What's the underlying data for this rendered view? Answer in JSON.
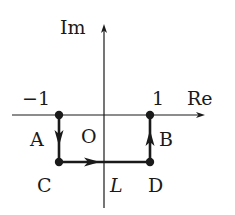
{
  "diagram": {
    "type": "complex-plane-contour",
    "axes": {
      "real_label": "Re",
      "imag_label": "Im",
      "origin_label": "O",
      "tick_neg_one": "−1",
      "tick_one": "1"
    },
    "points": {
      "A": "A",
      "B": "B",
      "C": "C",
      "D": "D"
    },
    "contour_label": "L",
    "path_order": [
      "A",
      "C",
      "D",
      "B"
    ],
    "colors": {
      "ink": "#1a1a1a",
      "background": "#ffffff"
    }
  }
}
